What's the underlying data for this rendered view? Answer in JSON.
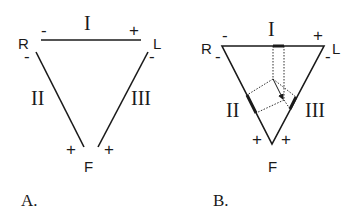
{
  "diagram_a": {
    "caption": "A.",
    "vertices": {
      "right_arm": "R",
      "left_arm": "L",
      "foot": "F"
    },
    "leads": {
      "lead_1": "I",
      "lead_2": "II",
      "lead_3": "III"
    },
    "polarity": {
      "lead_1_neg": "-",
      "lead_1_pos": "+",
      "lead_2_neg": "-",
      "lead_2_pos": "+",
      "lead_3_neg": "-",
      "lead_3_pos": "+"
    }
  },
  "diagram_b": {
    "caption": "B.",
    "vertices": {
      "right_arm": "R",
      "left_arm": "L",
      "foot": "F"
    },
    "leads": {
      "lead_1": "I",
      "lead_2": "II",
      "lead_3": "III"
    },
    "polarity": {
      "lead_1_neg": "-",
      "lead_1_pos": "+",
      "lead_2_neg": "-",
      "lead_2_pos": "+",
      "lead_3_neg": "-",
      "lead_3_pos": "+"
    }
  },
  "colors": {
    "ink": "#1a1a1a",
    "background": "#ffffff"
  }
}
